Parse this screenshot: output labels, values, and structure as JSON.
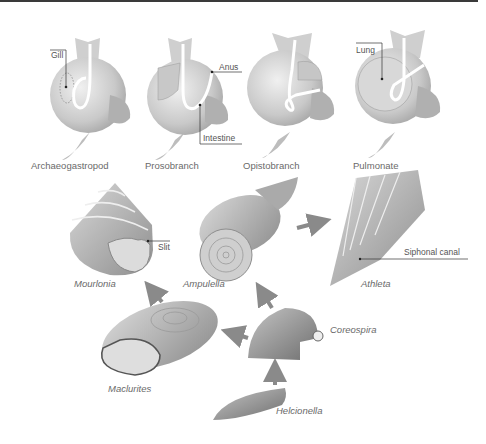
{
  "diagram": {
    "type": "gastropod-evolution",
    "body_plans": [
      {
        "name": "Archaeogastropod",
        "callouts": [
          "Gill"
        ]
      },
      {
        "name": "Prosobranch",
        "callouts": [
          "Anus",
          "Intestine"
        ]
      },
      {
        "name": "Opistobranch",
        "callouts": []
      },
      {
        "name": "Pulmonate",
        "callouts": [
          "Lung"
        ]
      }
    ],
    "shells": [
      {
        "name": "Mourlonia",
        "callout": "Slit"
      },
      {
        "name": "Ampulella"
      },
      {
        "name": "Athleta",
        "callout": "Siphonal canal"
      },
      {
        "name": "Maclurites"
      },
      {
        "name": "Coreospira"
      },
      {
        "name": "Helcionella"
      }
    ],
    "arrows": [
      {
        "from": "Helcionella",
        "to": "Coreospira"
      },
      {
        "from": "Coreospira",
        "to": "Maclurites"
      },
      {
        "from": "Coreospira",
        "to": "Ampulella"
      },
      {
        "from": "Maclurites",
        "to": "Mourlonia"
      },
      {
        "from": "Ampulella",
        "to": "Athleta"
      }
    ],
    "colors": {
      "arrow": "#8a8a8a",
      "shell": "#b5b5b5",
      "body": "#d6d6d6",
      "text": "#5a5a5a"
    }
  }
}
